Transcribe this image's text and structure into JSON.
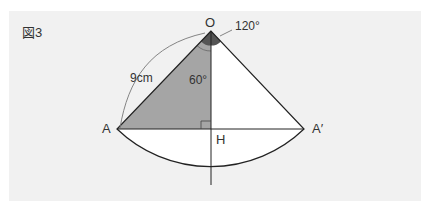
{
  "figure": {
    "label": "図3",
    "points": {
      "O": "O",
      "A": "A",
      "A_prime": "A′",
      "H": "H"
    },
    "annotations": {
      "length": "9cm",
      "angle_inner": "60°",
      "angle_outer": "120°"
    },
    "colors": {
      "background": "#f1f1f1",
      "shaded_triangle": "#a5a5a5",
      "angle_mark": "#555555",
      "lines": "#222222"
    }
  }
}
